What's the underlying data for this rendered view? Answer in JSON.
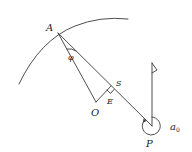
{
  "diagram": {
    "labels": {
      "A": "A",
      "phi": "φ",
      "S": "S",
      "E": "E",
      "O": "O",
      "P": "P",
      "alpha": "a",
      "alpha_sub": "0"
    },
    "colors": {
      "stroke": "#3a3a3a",
      "text": "#222222",
      "background": "#ffffff"
    }
  }
}
